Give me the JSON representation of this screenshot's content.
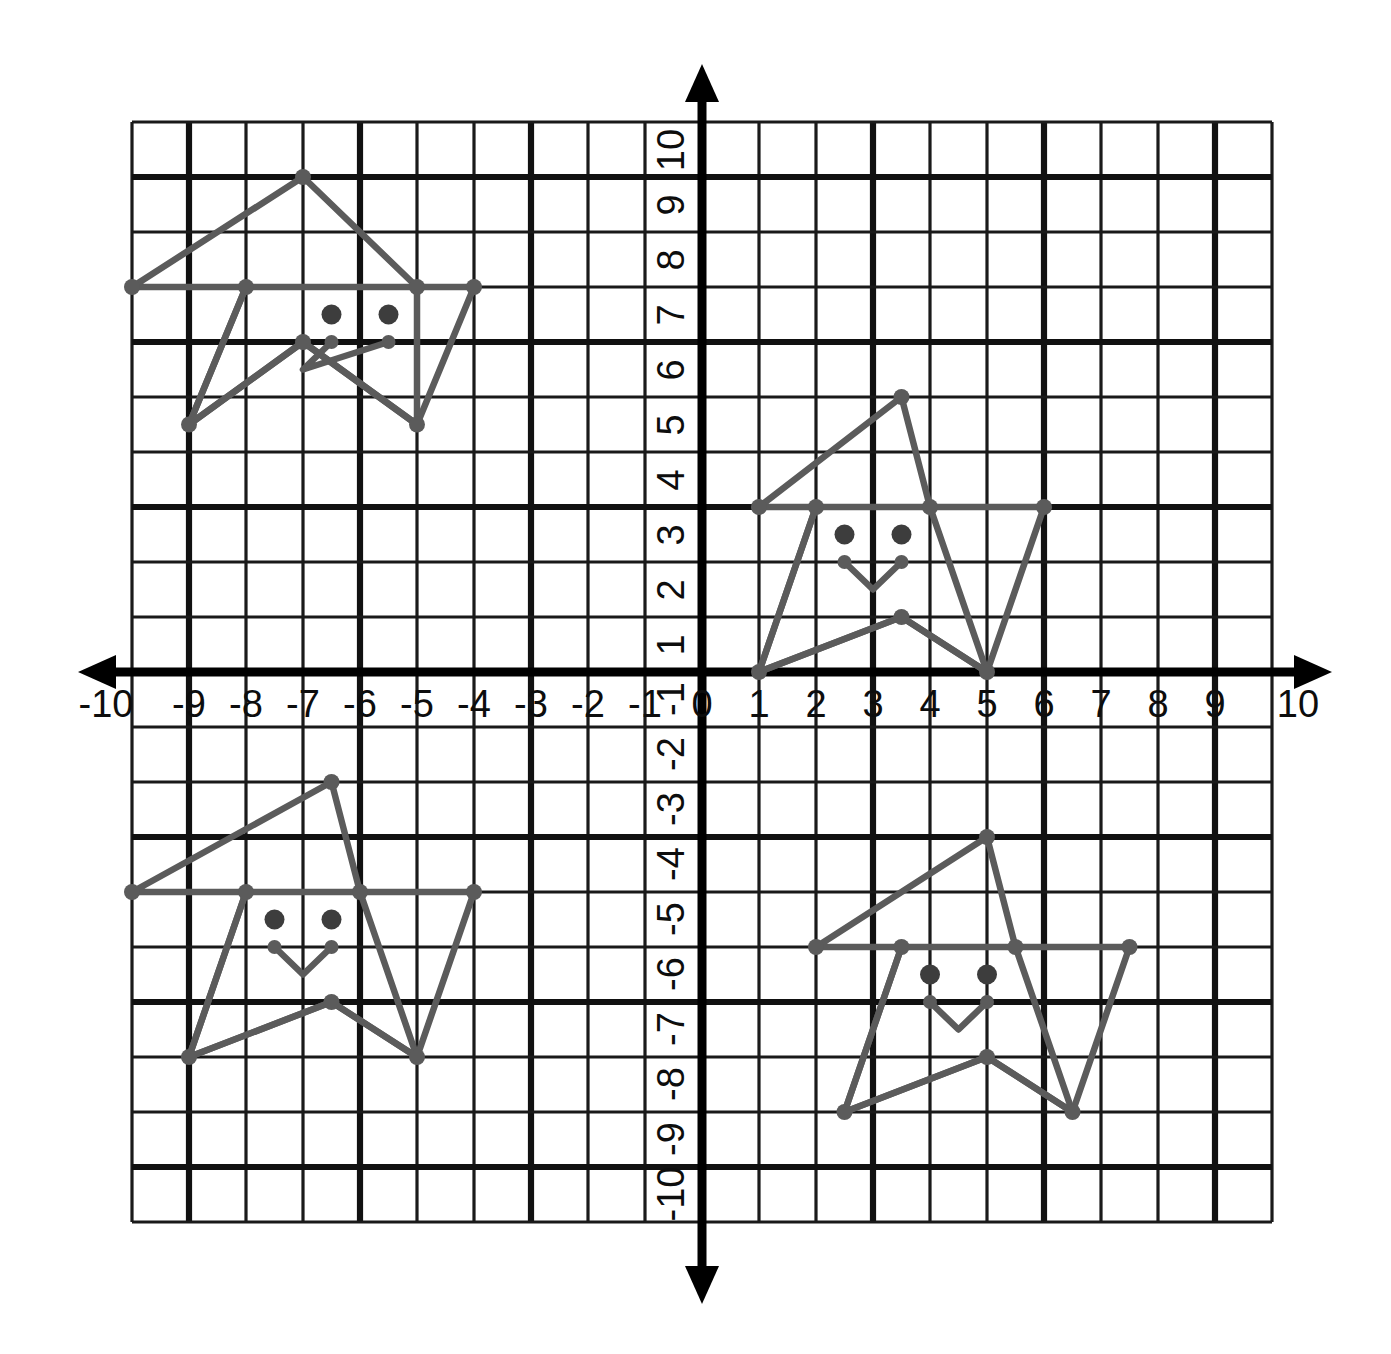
{
  "figure": {
    "type": "coordinate-grid"
  },
  "chart_data": {
    "type": "scatter",
    "title": "",
    "subtitle": "",
    "xlabel": "",
    "ylabel": "",
    "xlim": [
      -10,
      10
    ],
    "ylim": [
      -10,
      10
    ],
    "grid": true,
    "legend": null,
    "x_tick_labels": [
      "-10",
      "-9",
      "-8",
      "-7",
      "-6",
      "-5",
      "-4",
      "-3",
      "-2",
      "-1",
      "0",
      "1",
      "2",
      "3",
      "4",
      "5",
      "6",
      "7",
      "8",
      "9",
      "10"
    ],
    "y_tick_labels": [
      "10",
      "9",
      "8",
      "7",
      "6",
      "5",
      "4",
      "3",
      "2",
      "1",
      "-1",
      "-2",
      "-3",
      "-4",
      "-5",
      "-6",
      "-7",
      "-8",
      "-9",
      "-10"
    ],
    "x_ticks": [
      -10,
      -9,
      -8,
      -7,
      -6,
      -5,
      -4,
      -3,
      -2,
      -1,
      0,
      1,
      2,
      3,
      4,
      5,
      6,
      7,
      8,
      9,
      10
    ],
    "y_ticks": [
      10,
      9,
      8,
      7,
      6,
      5,
      4,
      3,
      2,
      1,
      -1,
      -2,
      -3,
      -4,
      -5,
      -6,
      -7,
      -8,
      -9,
      -10
    ],
    "y_label_rotation": -90,
    "axis_arrows": [
      "left",
      "right",
      "up",
      "down"
    ],
    "major_gridline_step": 3,
    "colors": {
      "grid": "#1a1a1a",
      "axis": "#000000",
      "figure_stroke": "#5b5b5b",
      "eye_dot": "#3d3d3d",
      "background": "#ffffff"
    },
    "series": [
      {
        "name": "star-quadrant-II",
        "quadrant": "II",
        "outline": [
          [
            -7,
            9
          ],
          [
            -5,
            7
          ],
          [
            -4,
            7
          ],
          [
            -5,
            4.5
          ],
          [
            -7,
            6
          ],
          [
            -9,
            4.5
          ],
          [
            -8,
            7
          ],
          [
            -10,
            7
          ],
          [
            -7,
            9
          ]
        ],
        "outline_closed": true,
        "inner_pentagon": [
          [
            -8,
            7
          ],
          [
            -5,
            7
          ],
          [
            -5,
            4.5
          ],
          [
            -7,
            6
          ],
          [
            -9,
            4.5
          ]
        ],
        "eyes": [
          [
            -6.5,
            6.5
          ],
          [
            -5.5,
            6.5
          ]
        ],
        "mouth": [
          [
            -6.5,
            6
          ],
          [
            -7,
            5.5
          ],
          [
            -5.5,
            6
          ]
        ],
        "mouth_dots": [
          [
            -6.5,
            6
          ],
          [
            -5.5,
            6
          ]
        ],
        "vertices": [
          [
            -7,
            9
          ],
          [
            -4,
            7
          ],
          [
            -5,
            4.5
          ],
          [
            -9,
            4.5
          ],
          [
            -10,
            7
          ],
          [
            -8,
            7
          ],
          [
            -5,
            7
          ],
          [
            -7,
            6
          ]
        ]
      },
      {
        "name": "star-quadrant-I",
        "quadrant": "I",
        "outline": [
          [
            3.5,
            5
          ],
          [
            4,
            3
          ],
          [
            6,
            3
          ],
          [
            5,
            0
          ],
          [
            3.5,
            1
          ],
          [
            1,
            0
          ],
          [
            2,
            3
          ],
          [
            1,
            3
          ],
          [
            3.5,
            5
          ]
        ],
        "outline_closed": true,
        "inner_pentagon": [
          [
            2,
            3
          ],
          [
            4,
            3
          ],
          [
            5,
            0
          ],
          [
            3.5,
            1
          ],
          [
            1,
            0
          ]
        ],
        "eyes": [
          [
            2.5,
            2.5
          ],
          [
            3.5,
            2.5
          ]
        ],
        "mouth": [
          [
            2.5,
            2
          ],
          [
            3,
            1.5
          ],
          [
            3.5,
            2
          ]
        ],
        "mouth_dots": [
          [
            2.5,
            2
          ],
          [
            3.5,
            2
          ]
        ],
        "vertices": [
          [
            3.5,
            5
          ],
          [
            6,
            3
          ],
          [
            5,
            0
          ],
          [
            1,
            0
          ],
          [
            1,
            3
          ],
          [
            2,
            3
          ],
          [
            4,
            3
          ],
          [
            3.5,
            1
          ]
        ]
      },
      {
        "name": "star-quadrant-III",
        "quadrant": "III",
        "outline": [
          [
            -6.5,
            -2
          ],
          [
            -6,
            -4
          ],
          [
            -4,
            -4
          ],
          [
            -5,
            -7
          ],
          [
            -6.5,
            -6
          ],
          [
            -9,
            -7
          ],
          [
            -8,
            -4
          ],
          [
            -10,
            -4
          ],
          [
            -6.5,
            -2
          ]
        ],
        "outline_closed": true,
        "inner_pentagon": [
          [
            -8,
            -4
          ],
          [
            -6,
            -4
          ],
          [
            -5,
            -7
          ],
          [
            -6.5,
            -6
          ],
          [
            -9,
            -7
          ]
        ],
        "eyes": [
          [
            -7.5,
            -4.5
          ],
          [
            -6.5,
            -4.5
          ]
        ],
        "mouth": [
          [
            -7.5,
            -5
          ],
          [
            -7,
            -5.5
          ],
          [
            -6.5,
            -5
          ]
        ],
        "mouth_dots": [
          [
            -7.5,
            -5
          ],
          [
            -6.5,
            -5
          ]
        ],
        "vertices": [
          [
            -6.5,
            -2
          ],
          [
            -4,
            -4
          ],
          [
            -5,
            -7
          ],
          [
            -9,
            -7
          ],
          [
            -10,
            -4
          ],
          [
            -8,
            -4
          ],
          [
            -6,
            -4
          ],
          [
            -6.5,
            -6
          ]
        ]
      },
      {
        "name": "star-quadrant-IV",
        "quadrant": "IV",
        "outline": [
          [
            5,
            -3
          ],
          [
            5.5,
            -5
          ],
          [
            7.5,
            -5
          ],
          [
            6.5,
            -8
          ],
          [
            5,
            -7
          ],
          [
            2.5,
            -8
          ],
          [
            3.5,
            -5
          ],
          [
            2,
            -5
          ],
          [
            5,
            -3
          ]
        ],
        "outline_closed": true,
        "inner_pentagon": [
          [
            3.5,
            -5
          ],
          [
            5.5,
            -5
          ],
          [
            6.5,
            -8
          ],
          [
            5,
            -7
          ],
          [
            2.5,
            -8
          ]
        ],
        "eyes": [
          [
            4,
            -5.5
          ],
          [
            5,
            -5.5
          ]
        ],
        "mouth": [
          [
            4,
            -6
          ],
          [
            4.5,
            -6.5
          ],
          [
            5,
            -6
          ]
        ],
        "mouth_dots": [
          [
            4,
            -6
          ],
          [
            5,
            -6
          ]
        ],
        "vertices": [
          [
            5,
            -3
          ],
          [
            7.5,
            -5
          ],
          [
            6.5,
            -8
          ],
          [
            2.5,
            -8
          ],
          [
            2,
            -5
          ],
          [
            3.5,
            -5
          ],
          [
            5.5,
            -5
          ],
          [
            5,
            -7
          ]
        ]
      }
    ]
  }
}
